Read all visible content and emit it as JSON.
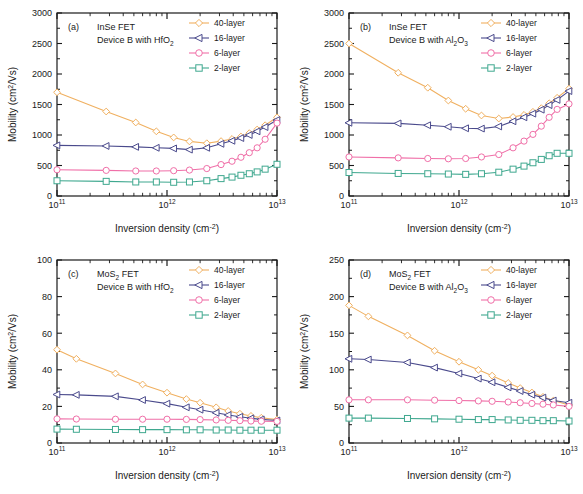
{
  "figure": {
    "axis_labels": {
      "x_main": "Inversion density (cm",
      "x_exp": "-2",
      "x_close": ")",
      "y_main": "Mobility (cm",
      "y_sup": "2",
      "y_tail": "/Vs)"
    },
    "series_colors": {
      "40-layer": "#f0b060",
      "16-layer": "#4a4a8c",
      "6-layer": "#f06fa8",
      "2-layer": "#3fa88f"
    },
    "series_markers": {
      "40-layer": "diamond",
      "16-layer": "triangle-left",
      "6-layer": "circle",
      "2-layer": "square"
    },
    "x_tick_labels": [
      "10",
      "10",
      "10"
    ],
    "x_tick_exponents": [
      "11",
      "12",
      "13"
    ]
  },
  "chart_data": [
    {
      "id": "a",
      "type": "line",
      "panel_label": "(a)",
      "annotation_line1": "InSe FET",
      "annotation_line2_pre": "Device B with HfO",
      "annotation_line2_sub": "2",
      "title": "InSe FET Device B with HfO2",
      "xlabel": "Inversion density (cm-2)",
      "ylabel": "Mobility (cm2/Vs)",
      "xscale": "log",
      "xlim": [
        100000000000.0,
        10000000000000.0
      ],
      "ylim": [
        0,
        3000
      ],
      "yticks": [
        0,
        500,
        1000,
        1500,
        2000,
        2500,
        3000
      ],
      "ytick_labels": [
        "0",
        "500",
        "1000",
        "1500",
        "2000",
        "2500",
        "3000"
      ],
      "grid": false,
      "legend_position": "top-right",
      "series": [
        {
          "name": "40-layer",
          "x": [
            100000000000.0,
            280000000000.0,
            520000000000.0,
            800000000000.0,
            1150000000000.0,
            1600000000000.0,
            2300000000000.0,
            3100000000000.0,
            3900000000000.0,
            4700000000000.0,
            5600000000000.0,
            6600000000000.0,
            7800000000000.0,
            10000000000000.0
          ],
          "values": [
            1700,
            1385,
            1205,
            1060,
            960,
            895,
            865,
            900,
            935,
            975,
            1030,
            1090,
            1160,
            1290
          ]
        },
        {
          "name": "16-layer",
          "x": [
            100000000000.0,
            280000000000.0,
            520000000000.0,
            800000000000.0,
            1150000000000.0,
            1600000000000.0,
            2300000000000.0,
            3100000000000.0,
            3900000000000.0,
            4700000000000.0,
            5600000000000.0,
            6600000000000.0,
            7800000000000.0,
            10000000000000.0
          ],
          "values": [
            830,
            820,
            805,
            790,
            780,
            760,
            790,
            855,
            905,
            950,
            1000,
            1060,
            1130,
            1245
          ]
        },
        {
          "name": "6-layer",
          "x": [
            100000000000.0,
            280000000000.0,
            520000000000.0,
            800000000000.0,
            1150000000000.0,
            1600000000000.0,
            2300000000000.0,
            3100000000000.0,
            3900000000000.0,
            4700000000000.0,
            5600000000000.0,
            6600000000000.0,
            7800000000000.0,
            10000000000000.0
          ],
          "values": [
            430,
            420,
            410,
            410,
            415,
            425,
            450,
            515,
            570,
            635,
            710,
            790,
            930,
            1195
          ]
        },
        {
          "name": "2-layer",
          "x": [
            100000000000.0,
            280000000000.0,
            520000000000.0,
            800000000000.0,
            1150000000000.0,
            1600000000000.0,
            2300000000000.0,
            3100000000000.0,
            3900000000000.0,
            4700000000000.0,
            5600000000000.0,
            6600000000000.0,
            7800000000000.0,
            10000000000000.0
          ],
          "values": [
            250,
            240,
            230,
            230,
            225,
            230,
            250,
            285,
            310,
            340,
            365,
            395,
            440,
            520
          ]
        }
      ]
    },
    {
      "id": "b",
      "type": "line",
      "panel_label": "(b)",
      "annotation_line1": "InSe FET",
      "annotation_line2_pre": "Device B with Al",
      "annotation_line2_sub": "2",
      "annotation_line2_mid": "O",
      "annotation_line2_sub2": "3",
      "title": "InSe FET Device B with Al2O3",
      "xlabel": "Inversion density (cm-2)",
      "ylabel": "Mobility (cm2/Vs)",
      "xscale": "log",
      "xlim": [
        100000000000.0,
        10000000000000.0
      ],
      "ylim": [
        0,
        3000
      ],
      "yticks": [
        0,
        500,
        1000,
        1500,
        2000,
        2500,
        3000
      ],
      "ytick_labels": [
        "0",
        "500",
        "1000",
        "1500",
        "2000",
        "2500",
        "3000"
      ],
      "grid": false,
      "legend_position": "top-right",
      "series": [
        {
          "name": "40-layer",
          "x": [
            100000000000.0,
            280000000000.0,
            520000000000.0,
            800000000000.0,
            1150000000000.0,
            1600000000000.0,
            2300000000000.0,
            3100000000000.0,
            3900000000000.0,
            4700000000000.0,
            5600000000000.0,
            6600000000000.0,
            7800000000000.0,
            10000000000000.0
          ],
          "values": [
            2500,
            2020,
            1775,
            1565,
            1430,
            1320,
            1270,
            1295,
            1330,
            1380,
            1440,
            1520,
            1610,
            1760
          ]
        },
        {
          "name": "16-layer",
          "x": [
            100000000000.0,
            280000000000.0,
            520000000000.0,
            800000000000.0,
            1150000000000.0,
            1600000000000.0,
            2300000000000.0,
            3100000000000.0,
            3900000000000.0,
            4700000000000.0,
            5600000000000.0,
            6600000000000.0,
            7800000000000.0,
            10000000000000.0
          ],
          "values": [
            1200,
            1190,
            1160,
            1135,
            1110,
            1105,
            1140,
            1225,
            1290,
            1350,
            1415,
            1490,
            1575,
            1720
          ]
        },
        {
          "name": "6-layer",
          "x": [
            100000000000.0,
            280000000000.0,
            520000000000.0,
            800000000000.0,
            1150000000000.0,
            1600000000000.0,
            2300000000000.0,
            3100000000000.0,
            3900000000000.0,
            4700000000000.0,
            5600000000000.0,
            6600000000000.0,
            7800000000000.0,
            10000000000000.0
          ],
          "values": [
            640,
            625,
            615,
            610,
            615,
            640,
            680,
            790,
            900,
            1010,
            1145,
            1290,
            1420,
            1510
          ]
        },
        {
          "name": "2-layer",
          "x": [
            100000000000.0,
            280000000000.0,
            520000000000.0,
            800000000000.0,
            1150000000000.0,
            1600000000000.0,
            2300000000000.0,
            3100000000000.0,
            3900000000000.0,
            4700000000000.0,
            5600000000000.0,
            6600000000000.0,
            7800000000000.0,
            10000000000000.0
          ],
          "values": [
            385,
            370,
            365,
            360,
            355,
            365,
            390,
            440,
            490,
            545,
            600,
            660,
            700,
            700
          ]
        }
      ]
    },
    {
      "id": "c",
      "type": "line",
      "panel_label": "(c)",
      "annotation_line1_pre": "MoS",
      "annotation_line1_sub": "2",
      "annotation_line1_post": " FET",
      "annotation_line2_pre": "Device B with HfO",
      "annotation_line2_sub": "2",
      "title": "MoS2 FET Device B with HfO2",
      "xlabel": "Inversion density (cm-2)",
      "ylabel": "Mobility (cm2/Vs)",
      "xscale": "log",
      "xlim": [
        100000000000.0,
        10000000000000.0
      ],
      "ylim": [
        0,
        100
      ],
      "yticks": [
        0,
        20,
        40,
        60,
        80,
        100
      ],
      "ytick_labels": [
        "0",
        "20",
        "40",
        "60",
        "80",
        "100"
      ],
      "grid": false,
      "legend_position": "top-right",
      "series": [
        {
          "name": "40-layer",
          "x": [
            100000000000.0,
            150000000000.0,
            340000000000.0,
            600000000000.0,
            1000000000000.0,
            1500000000000.0,
            2000000000000.0,
            2800000000000.0,
            3600000000000.0,
            4600000000000.0,
            5800000000000.0,
            7200000000000.0,
            10000000000000.0
          ],
          "values": [
            51,
            46,
            38,
            32,
            27.5,
            24,
            22,
            19.5,
            17.5,
            16,
            14.8,
            13.8,
            12.8
          ]
        },
        {
          "name": "16-layer",
          "x": [
            100000000000.0,
            150000000000.0,
            340000000000.0,
            600000000000.0,
            1000000000000.0,
            1500000000000.0,
            2000000000000.0,
            2800000000000.0,
            3600000000000.0,
            4600000000000.0,
            5800000000000.0,
            7200000000000.0,
            10000000000000.0
          ],
          "values": [
            26.5,
            26.3,
            25.5,
            23.5,
            21.5,
            19.5,
            18.2,
            16.5,
            15.3,
            14.3,
            13.5,
            12.9,
            12.3
          ]
        },
        {
          "name": "6-layer",
          "x": [
            100000000000.0,
            150000000000.0,
            340000000000.0,
            600000000000.0,
            1000000000000.0,
            1500000000000.0,
            2000000000000.0,
            2800000000000.0,
            3600000000000.0,
            4600000000000.0,
            5800000000000.0,
            7200000000000.0,
            10000000000000.0
          ],
          "values": [
            13.2,
            13.1,
            13.0,
            13.0,
            13.0,
            12.9,
            12.8,
            12.6,
            12.4,
            12.2,
            12.0,
            11.9,
            11.8
          ]
        },
        {
          "name": "2-layer",
          "x": [
            100000000000.0,
            150000000000.0,
            340000000000.0,
            600000000000.0,
            1000000000000.0,
            1500000000000.0,
            2000000000000.0,
            2800000000000.0,
            3600000000000.0,
            4600000000000.0,
            5800000000000.0,
            7200000000000.0,
            10000000000000.0
          ],
          "values": [
            7.6,
            7.5,
            7.4,
            7.3,
            7.3,
            7.2,
            7.2,
            7.1,
            7.1,
            7.0,
            7.0,
            7.0,
            7.0
          ]
        }
      ]
    },
    {
      "id": "d",
      "type": "line",
      "panel_label": "(d)",
      "annotation_line1_pre": "MoS",
      "annotation_line1_sub": "2",
      "annotation_line1_post": " FET",
      "annotation_line2_pre": "Device B with Al",
      "annotation_line2_sub": "2",
      "annotation_line2_mid": "O",
      "annotation_line2_sub2": "3",
      "title": "MoS2 FET Device B with Al2O3",
      "xlabel": "Inversion density (cm-2)",
      "ylabel": "Mobility (cm2/Vs)",
      "xscale": "log",
      "xlim": [
        100000000000.0,
        10000000000000.0
      ],
      "ylim": [
        0,
        250
      ],
      "yticks": [
        0,
        50,
        100,
        150,
        200,
        250
      ],
      "ytick_labels": [
        "0",
        "50",
        "100",
        "150",
        "200",
        "250"
      ],
      "grid": false,
      "legend_position": "top-right",
      "series": [
        {
          "name": "40-layer",
          "x": [
            100000000000.0,
            150000000000.0,
            340000000000.0,
            600000000000.0,
            1000000000000.0,
            1500000000000.0,
            2000000000000.0,
            2800000000000.0,
            3600000000000.0,
            4600000000000.0,
            5800000000000.0,
            7200000000000.0,
            10000000000000.0
          ],
          "values": [
            188,
            173,
            147,
            126,
            111,
            100,
            92,
            82,
            75,
            69,
            63,
            58,
            52
          ]
        },
        {
          "name": "16-layer",
          "x": [
            100000000000.0,
            150000000000.0,
            340000000000.0,
            600000000000.0,
            1000000000000.0,
            1500000000000.0,
            2000000000000.0,
            2800000000000.0,
            3600000000000.0,
            4600000000000.0,
            5800000000000.0,
            7200000000000.0,
            10000000000000.0
          ],
          "values": [
            115,
            114,
            110,
            103,
            95,
            88,
            83,
            76,
            71,
            66,
            62,
            58,
            55
          ]
        },
        {
          "name": "6-layer",
          "x": [
            100000000000.0,
            150000000000.0,
            340000000000.0,
            600000000000.0,
            1000000000000.0,
            1500000000000.0,
            2000000000000.0,
            2800000000000.0,
            3600000000000.0,
            4600000000000.0,
            5800000000000.0,
            7200000000000.0,
            10000000000000.0
          ],
          "values": [
            59,
            59,
            59,
            58.5,
            58,
            57.5,
            57,
            56,
            55,
            54,
            53,
            52,
            50
          ]
        },
        {
          "name": "2-layer",
          "x": [
            100000000000.0,
            150000000000.0,
            340000000000.0,
            600000000000.0,
            1000000000000.0,
            1500000000000.0,
            2000000000000.0,
            2800000000000.0,
            3600000000000.0,
            4600000000000.0,
            5800000000000.0,
            7200000000000.0,
            10000000000000.0
          ],
          "values": [
            34,
            34,
            33.5,
            33,
            32.5,
            32,
            32,
            31.5,
            31,
            31,
            30.5,
            30.5,
            30
          ]
        }
      ]
    }
  ],
  "legend": {
    "entries": [
      {
        "label": "40-layer",
        "marker": "diamond",
        "color": "#f0b060"
      },
      {
        "label": "16-layer",
        "marker": "triangle-left",
        "color": "#4a4a8c"
      },
      {
        "label": "6-layer",
        "marker": "circle",
        "color": "#f06fa8"
      },
      {
        "label": "2-layer",
        "marker": "square",
        "color": "#3fa88f"
      }
    ]
  }
}
